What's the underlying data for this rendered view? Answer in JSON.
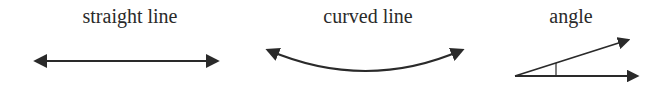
{
  "figures": [
    {
      "label": "straight line",
      "shape": "double-arrow-straight",
      "label_x": 130,
      "path": "M 36 61 L 217 61",
      "arrowheads": [
        "left",
        "right"
      ]
    },
    {
      "label": "curved line",
      "shape": "double-arrow-curved",
      "label_x": 368,
      "path": "M 268 50 Q 366 92 462 50",
      "arrowheads": [
        "left",
        "right"
      ]
    },
    {
      "label": "angle",
      "shape": "angle-two-rays",
      "label_x": 571,
      "rays": [
        {
          "from": [
            515,
            76
          ],
          "to": [
            628,
            40
          ]
        },
        {
          "from": [
            515,
            76
          ],
          "to": [
            637,
            76
          ]
        }
      ],
      "angle_mark": {
        "x": 556,
        "y1": 63,
        "y2": 76
      }
    }
  ],
  "colors": {
    "stroke": "#2a2a2a",
    "text": "#2a2a2a",
    "background": "#ffffff"
  }
}
